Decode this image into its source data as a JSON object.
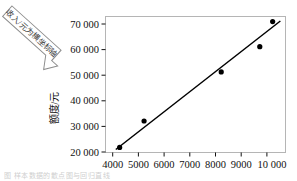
{
  "chart_data": {
    "type": "scatter",
    "title": "",
    "subtitle": "",
    "xlabel": "",
    "ylabel": "额度/元",
    "xlim": [
      3500,
      10500
    ],
    "ylim": [
      18000,
      72000
    ],
    "grid": false,
    "legend_position": "none",
    "x_ticks": [
      "4000",
      "5000",
      "6000",
      "7000",
      "8000",
      "9000",
      "10 000"
    ],
    "x_tick_values": [
      4000,
      5000,
      6000,
      7000,
      8000,
      9000,
      10000
    ],
    "y_ticks": [
      "20 000",
      "30 000",
      "40 000",
      "50 000",
      "60 000",
      "70 000"
    ],
    "y_tick_values": [
      20000,
      30000,
      40000,
      50000,
      60000,
      70000
    ],
    "series": [
      {
        "name": "样本点",
        "marker": "filled-circle",
        "color": "#000000",
        "x": [
          4050,
          5000,
          8000,
          9500,
          10000
        ],
        "y": [
          20000,
          30500,
          50000,
          60000,
          70000
        ]
      }
    ],
    "fit_line": {
      "name": "回归直线",
      "color": "#000000",
      "x": [
        3900,
        10300
      ],
      "y": [
        19200,
        70200
      ]
    },
    "annotations": [
      {
        "name": "callout-arrow",
        "text": "收入/元为横坐标轴",
        "rotation_deg": 42,
        "points_to": "y-axis-origin"
      }
    ]
  },
  "caption": {
    "bottom_text": "图     样本数据的散点图与回归直线"
  },
  "colors": {
    "axis": "#9b9b9b",
    "frame": "#b5b5b5",
    "marker": "#000000",
    "line": "#000000",
    "text": "#111111",
    "callout_stroke": "#8d8d8d",
    "caption": "#cfcfcf"
  }
}
